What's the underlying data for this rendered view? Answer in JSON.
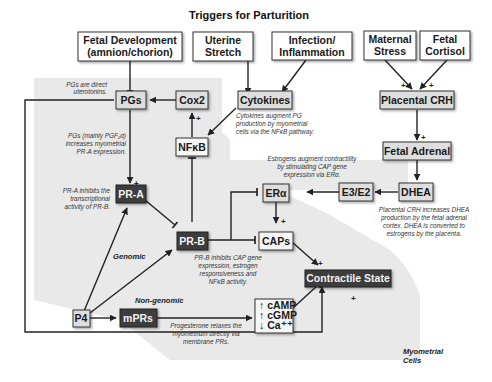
{
  "title": "Triggers for Parturition",
  "triggers": [
    {
      "id": "fetal_development",
      "line1": "Fetal Development",
      "line2": "(amnion/chorion)"
    },
    {
      "id": "uterine_stretch",
      "line1": "Uterine",
      "line2": "Stretch"
    },
    {
      "id": "infection",
      "line1": "Infection/",
      "line2": "Inflammation"
    },
    {
      "id": "maternal_stress",
      "line1": "Maternal",
      "line2": "Stress"
    },
    {
      "id": "fetal_cortisol",
      "line1": "Fetal",
      "line2": "Cortisol"
    }
  ],
  "nodes": {
    "pgs": "PGs",
    "cox2": "Cox2",
    "cytokines": "Cytokines",
    "nfkb": "NFκB",
    "placental_crh": "Placental CRH",
    "fetal_adrenal": "Fetal Adrenal",
    "dhea": "DHEA",
    "e3e2": "E3/E2",
    "era": "ERα",
    "pra": "PR-A",
    "prb": "PR-B",
    "caps": "CAPs",
    "contractile": "Contractile State",
    "p4": "P4",
    "mprs": "mPRs",
    "camp": "↑ cAMP",
    "cgmp": "↑ cGMP",
    "ca": "↓ Ca⁺⁺"
  },
  "notes": {
    "pgs_direct": [
      "PGs are direct",
      "uterotonins."
    ],
    "pgs_mainly": [
      "PGs (mainly PGF₂α)",
      "increases myometrial",
      "PR-A expression."
    ],
    "pra_inhibits": [
      "PR-A inhibits the",
      "transcriptional",
      "activity of PR-B."
    ],
    "cytokines_augment": [
      "Cytokines augment PG",
      "production by myometrial",
      "cells via the NFκB pathway."
    ],
    "estrogens_augment": [
      "Estrogens augment contractility",
      "by stimulating CAP gene",
      "expression via ERα."
    ],
    "crh_increases": [
      "Placental CRH increases DHEA",
      "production by the fetal adrenal",
      "cortex.  DHEA is converted to",
      "estrogens by the placenta."
    ],
    "prb_inhibits": [
      "PR-B inhibits CAP gene",
      "expression, estrogen",
      "responsiveness and",
      "NFκB activity."
    ],
    "progesterone_relaxes": [
      "Progesterone relaxes the",
      "myometrium directly via",
      "membrane PRs."
    ]
  },
  "sections": {
    "genomic": "Genomic",
    "non_genomic": "Non-genomic",
    "myometrial_line1": "Myometrial",
    "myometrial_line2": "Cells"
  },
  "signs": {
    "plus": "+"
  },
  "colors": {
    "region_gray": "#e8e8e8",
    "light_box": "#f7f7f7",
    "mid_box": "#dcdcdc",
    "dark_box": "#3d3d3d",
    "line": "#222222"
  }
}
